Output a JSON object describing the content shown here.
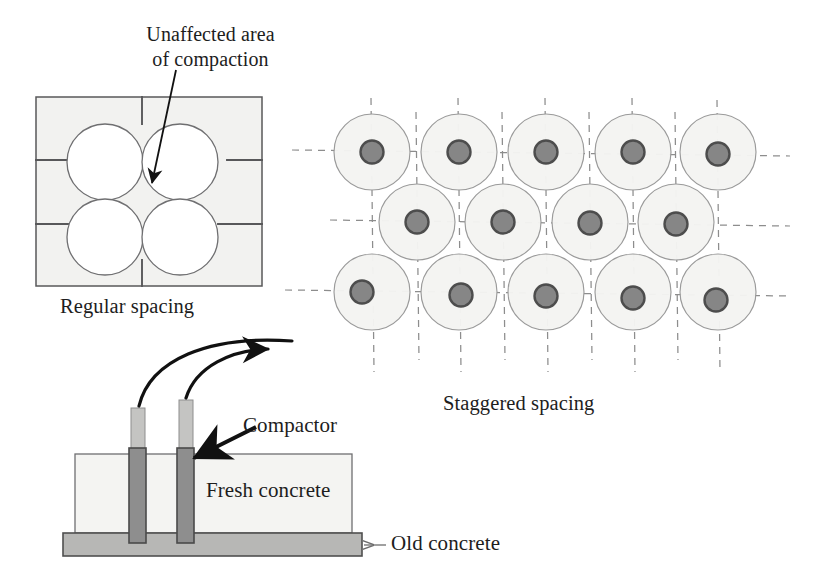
{
  "figure": {
    "title_hidden": "Compaction spacing of vibrating compactors in fresh concrete",
    "annotations": {
      "unaffected_area": "Unaffected area\nof compaction",
      "unaffected_area_line1": "Unaffected area",
      "unaffected_area_line2": "of compaction"
    }
  },
  "panels": {
    "regular": {
      "caption": "Regular spacing",
      "box": {
        "x": 36,
        "y": 97,
        "w": 226,
        "h": 189
      },
      "grid_h": [
        160,
        224
      ],
      "grid_v_top": [
        142
      ],
      "circle_radius": 38,
      "circle_centers": [
        {
          "cx": 105,
          "cy": 162
        },
        {
          "cx": 180,
          "cy": 162
        },
        {
          "cx": 105,
          "cy": 237
        },
        {
          "cx": 180,
          "cy": 237
        }
      ],
      "fill": "#f2f2f0",
      "circle_fill": "#ffffff",
      "line_color": "#58585a"
    },
    "staggered": {
      "caption": "Staggered spacing",
      "circle_radius": 38,
      "dot_radius": 11.5,
      "circle_fill": "#f4f4f2",
      "circle_stroke": "#9a9a9a",
      "dot_fill": "#868686",
      "dot_stroke": "#4d4d4d",
      "dash_color": "#8d8d8d",
      "rows": [
        {
          "row": 1,
          "cy": 152,
          "centers_x": [
            372,
            459,
            546,
            633,
            718
          ]
        },
        {
          "row": 2,
          "cy": 222,
          "centers_x": [
            417,
            503,
            590,
            676
          ]
        },
        {
          "row": 3,
          "cy": 292,
          "centers_x": [
            372,
            459,
            546,
            633,
            718
          ]
        }
      ]
    },
    "compactor": {
      "label_compactor": "Compactor",
      "label_fresh": "Fresh concrete",
      "label_old": "Old concrete",
      "fresh_box": {
        "x": 75,
        "y": 454,
        "w": 277,
        "h": 79
      },
      "old_slab": {
        "x": 63,
        "y": 533,
        "w": 299,
        "h": 23
      },
      "fresh_fill": "#f4f4f2",
      "old_fill": "#b7b7b5",
      "rod_shaft_fill": "#8e8e8e",
      "rod_head_fill": "#c4c4c2",
      "rods": [
        {
          "id": "rod-left",
          "x": 131,
          "w": 14,
          "head_top": 408,
          "head_bottom": 449,
          "shaft_top": 449,
          "shaft_bottom": 542
        },
        {
          "id": "rod-right",
          "x": 179,
          "w": 14,
          "head_top": 400,
          "head_bottom": 449,
          "shaft_top": 449,
          "shaft_bottom": 542
        }
      ],
      "arrow_color": "#111111",
      "old_arrow_color": "#6d6d6d"
    }
  },
  "colors": {
    "background": "#ffffff",
    "text": "#1d1d1d",
    "panel_outline": "#58585a",
    "circle_light": "#f4f4f2",
    "dot_gray": "#868686",
    "old_concrete_gray": "#b7b7b5"
  }
}
